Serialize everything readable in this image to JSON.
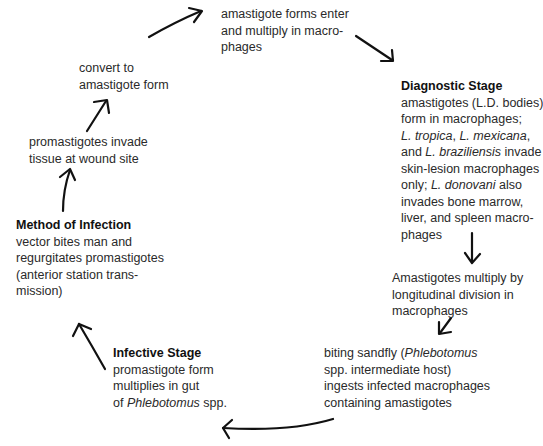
{
  "diagram": {
    "type": "life-cycle",
    "nodes": [
      {
        "id": "enter-macrophages",
        "lines": [
          "amastigote forms enter",
          "and multiply in macro-",
          "phages"
        ]
      },
      {
        "id": "diagnostic-stage",
        "title": "Diagnostic Stage",
        "lines": [
          "amastigotes (L.D. bodies)",
          "form in macrophages;",
          "L. tropica, L. mexicana,",
          "and L. braziliensis invade",
          "skin-lesion macrophages",
          "only; L. donovani also",
          "invades bone marrow,",
          "liver, and spleen macro-",
          "phages"
        ],
        "italic_terms": [
          "L. tropica",
          "L. mexicana",
          "L. braziliensis",
          "L. donovani"
        ]
      },
      {
        "id": "amastigotes-multiply",
        "lines": [
          "Amastigotes multiply by",
          "longitudinal division in",
          "macrophages"
        ]
      },
      {
        "id": "sandfly-bites",
        "lines": [
          "biting sandfly (Phlebotomus",
          "spp. intermediate host)",
          "ingests infected macrophages",
          "containing amastigotes"
        ],
        "italic_terms": [
          "Phlebotomus"
        ]
      },
      {
        "id": "infective-stage",
        "title": "Infective Stage",
        "lines": [
          "promastigote form",
          "multiplies in gut",
          "of Phlebotomus spp."
        ],
        "italic_terms": [
          "Phlebotomus"
        ]
      },
      {
        "id": "method-of-infection",
        "title": "Method of Infection",
        "lines": [
          "vector bites man and",
          "regurgitates promastigotes",
          "(anterior station trans-",
          "mission)"
        ]
      },
      {
        "id": "invade-tissue",
        "lines": [
          "promastigotes invade",
          "tissue at wound site"
        ]
      },
      {
        "id": "convert-amastigote",
        "lines": [
          "convert to",
          "amastigote form"
        ]
      }
    ],
    "arrows": [
      {
        "from": "convert-amastigote",
        "to": "enter-macrophages"
      },
      {
        "from": "enter-macrophages",
        "to": "diagnostic-stage"
      },
      {
        "from": "diagnostic-stage",
        "to": "amastigotes-multiply"
      },
      {
        "from": "amastigotes-multiply",
        "to": "sandfly-bites"
      },
      {
        "from": "sandfly-bites",
        "to": "infective-stage"
      },
      {
        "from": "infective-stage",
        "to": "method-of-infection"
      },
      {
        "from": "method-of-infection",
        "to": "invade-tissue"
      },
      {
        "from": "invade-tissue",
        "to": "convert-amastigote"
      }
    ]
  },
  "text": {
    "enter": [
      "amastigote forms enter",
      "and multiply in macro-",
      "phages"
    ],
    "diag_title": "Diagnostic Stage",
    "diag": {
      "l1": "amastigotes (L.D. bodies)",
      "l2": "form in macrophages;",
      "l3a": "L. tropica",
      "l3b": ", ",
      "l3c": "L. mexicana",
      "l3d": ",",
      "l4a": "and ",
      "l4b": "L. braziliensis",
      "l4c": " invade",
      "l5": "skin-lesion macrophages",
      "l6a": "only; ",
      "l6b": "L. donovani",
      "l6c": " also",
      "l7": "invades bone marrow,",
      "l8": "liver, and spleen macro-",
      "l9": "phages"
    },
    "multiply": [
      "Amastigotes multiply by",
      "longitudinal division in",
      "macrophages"
    ],
    "sandfly": {
      "l1a": "biting sandfly (",
      "l1b": "Phlebotomus",
      "l2": "spp. intermediate host)",
      "l3": "ingests infected macrophages",
      "l4": "containing amastigotes"
    },
    "infective_title": "Infective Stage",
    "infective": {
      "l1": "promastigote form",
      "l2": "multiplies in gut",
      "l3a": "of ",
      "l3b": "Phlebotomus",
      "l3c": " spp."
    },
    "method_title": "Method of Infection",
    "method": [
      "vector bites man and",
      "regurgitates promastigotes",
      "(anterior station trans-",
      "mission)"
    ],
    "invade": [
      "promastigotes invade",
      "tissue at wound site"
    ],
    "convert": [
      "convert to",
      "amastigote form"
    ]
  }
}
